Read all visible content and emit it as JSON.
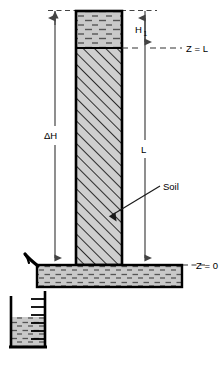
{
  "diagram": {
    "labels": {
      "delta_h": "ΔH",
      "h1_base": "H",
      "h1_subscript": "1",
      "length": "L",
      "soil": "Soil",
      "datum_top": "Z = L",
      "datum_bottom": "Z = 0"
    },
    "colors": {
      "water_fill": "#c9c9c9",
      "water_dash": "#555555",
      "soil_fill": "#cfcfcf",
      "soil_hatch": "#1a1a1a",
      "outline": "#000000",
      "dimension_line": "#555555",
      "dashed_datum": "#444444",
      "background": "#ffffff"
    },
    "parts": [
      {
        "name": "water-column",
        "description": "water ponded above soil in vertical column"
      },
      {
        "name": "soil-column",
        "description": "hatched soil specimen in vertical column"
      },
      {
        "name": "reservoir",
        "description": "horizontal outflow reservoir filled with water"
      },
      {
        "name": "overflow-spout",
        "description": "curved outlet hook at left of reservoir"
      },
      {
        "name": "graduated-cylinder",
        "description": "graduated collection cylinder partially filled"
      }
    ],
    "cylinder": {
      "tick_count": 6,
      "fill_fraction": 0.42
    }
  }
}
